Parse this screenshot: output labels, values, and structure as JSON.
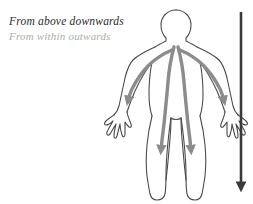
{
  "canvas": {
    "width": 253,
    "height": 204,
    "background": "#ffffff"
  },
  "captions": {
    "primary": {
      "text": "From above downwards",
      "color": "#2b2b2b"
    },
    "secondary": {
      "text": "From within outwards",
      "color": "#a9b0a4"
    }
  },
  "figure": {
    "name": "human-body-outline",
    "outline_color": "#4a4a4a",
    "outline_width": 1.1,
    "flow_arrow_color": "#8c8c8c",
    "flow_arrow_width": 3.4
  },
  "direction_arrow": {
    "name": "downward-direction-arrow",
    "color": "#3a3a3a",
    "x": 241,
    "y_start": 12,
    "y_end": 196,
    "width": 2.6
  },
  "flow_arrows": [
    {
      "name": "torso-left-flow",
      "ends_at": "left-calf"
    },
    {
      "name": "torso-right-flow",
      "ends_at": "right-calf"
    },
    {
      "name": "arm-left-flow",
      "ends_at": "left-wrist"
    },
    {
      "name": "arm-right-flow",
      "ends_at": "right-wrist"
    }
  ]
}
